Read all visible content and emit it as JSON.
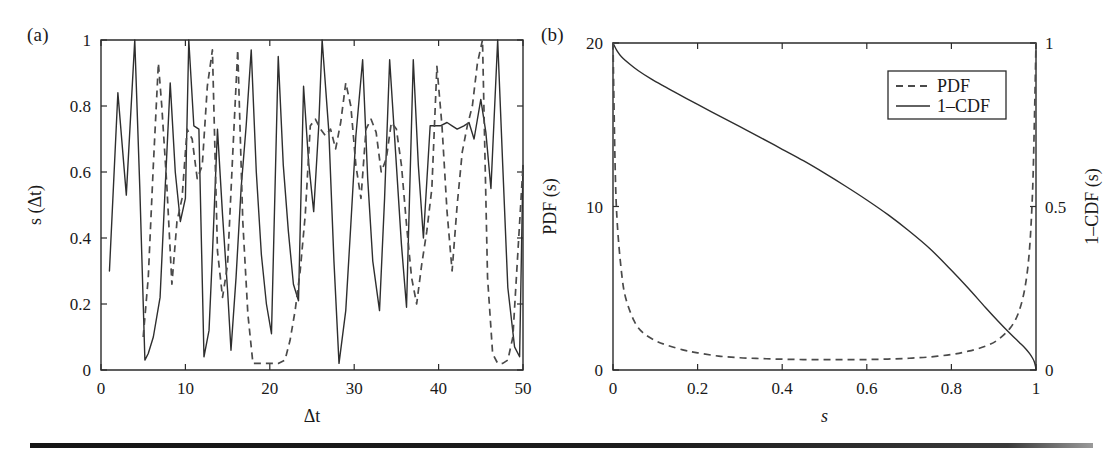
{
  "figure": {
    "panel_a_label": "(a)",
    "panel_b_label": "(b)"
  },
  "chart_data": [
    {
      "type": "line",
      "panel": "(a)",
      "title": "",
      "xlabel": "Δt",
      "ylabel": "s (Δt)",
      "xlim": [
        0,
        50
      ],
      "ylim": [
        0,
        1
      ],
      "xticks": [
        0,
        10,
        20,
        30,
        40,
        50
      ],
      "xtick_labels": [
        "0",
        "10",
        "20",
        "30",
        "40",
        "50"
      ],
      "yticks": [
        0,
        0.2,
        0.4,
        0.6,
        0.8,
        1
      ],
      "ytick_labels": [
        "0",
        "0.2",
        "0.4",
        "0.6",
        "0.8",
        "1"
      ],
      "grid": false,
      "legend": null,
      "series": [
        {
          "name": "solid-series",
          "style": "solid",
          "x": [
            1,
            2,
            3,
            4,
            4.6,
            5.2,
            5.6,
            6.2,
            7,
            7.6,
            8.2,
            8.8,
            9.4,
            10,
            10.4,
            11,
            11.6,
            12.2,
            12.8,
            13.2,
            13.8,
            14.4,
            15,
            15.4,
            16,
            16.6,
            17.2,
            17.8,
            18.4,
            19,
            19.6,
            20.2,
            21,
            21.6,
            22.2,
            22.8,
            23.4,
            24,
            24.6,
            25.2,
            25.8,
            26.2,
            27,
            27.6,
            28.2,
            29,
            29.6,
            30.2,
            31,
            31.6,
            32.2,
            33,
            33.6,
            34.2,
            35,
            35.6,
            36.2,
            37,
            37.6,
            38.2,
            39,
            39.6,
            40.2,
            41,
            41.6,
            42.2,
            43,
            43.6,
            44.2,
            45,
            45.6,
            46.2,
            47,
            47.6,
            48.2,
            49,
            49.6,
            50
          ],
          "y": [
            0.3,
            0.84,
            0.53,
            1.0,
            0.55,
            0.03,
            0.05,
            0.1,
            0.22,
            0.55,
            0.87,
            0.6,
            0.45,
            0.52,
            1.0,
            0.74,
            0.73,
            0.04,
            0.12,
            0.35,
            0.73,
            0.47,
            0.24,
            0.06,
            0.28,
            0.55,
            0.74,
            0.97,
            0.6,
            0.35,
            0.2,
            0.11,
            0.95,
            0.62,
            0.42,
            0.26,
            0.21,
            0.86,
            0.63,
            0.48,
            0.74,
            1.0,
            0.72,
            0.33,
            0.02,
            0.18,
            0.44,
            0.71,
            0.94,
            0.58,
            0.33,
            0.18,
            0.52,
            0.94,
            0.62,
            0.38,
            0.19,
            0.94,
            0.62,
            0.4,
            0.74,
            0.74,
            0.74,
            0.75,
            0.74,
            0.73,
            0.74,
            0.75,
            0.7,
            0.82,
            0.72,
            0.55,
            1.0,
            0.62,
            0.25,
            0.07,
            0.04,
            0.62
          ],
          "description": "Solid oscillating similarity trace"
        },
        {
          "name": "dashed-series",
          "style": "dashed",
          "x": [
            5,
            5.6,
            6.2,
            6.8,
            7.2,
            7.8,
            8.4,
            9,
            9.6,
            10.2,
            10.8,
            11.4,
            12,
            12.6,
            13.2,
            13.8,
            14.4,
            15,
            15.6,
            16.2,
            16.8,
            17.4,
            18,
            19,
            20,
            21,
            21.8,
            22.4,
            23,
            23.6,
            24.2,
            24.8,
            25.4,
            26,
            26.6,
            27.2,
            27.8,
            28.4,
            29,
            29.6,
            30.2,
            30.8,
            31.4,
            32,
            32.6,
            33.2,
            33.8,
            34.4,
            35,
            35.6,
            36.2,
            36.8,
            37.4,
            38,
            38.6,
            39.2,
            39.8,
            40.4,
            41,
            41.6,
            42.2,
            42.8,
            43.4,
            44,
            44.6,
            45.2,
            45.8,
            46.4,
            47,
            47.6,
            48.2,
            48.8,
            49.4,
            50
          ],
          "y": [
            0.1,
            0.28,
            0.62,
            0.93,
            0.8,
            0.56,
            0.26,
            0.45,
            0.52,
            0.73,
            0.7,
            0.58,
            0.62,
            0.86,
            0.97,
            0.36,
            0.22,
            0.32,
            0.65,
            0.97,
            0.45,
            0.17,
            0.02,
            0.02,
            0.02,
            0.02,
            0.03,
            0.09,
            0.18,
            0.3,
            0.47,
            0.74,
            0.76,
            0.73,
            0.71,
            0.73,
            0.67,
            0.75,
            0.87,
            0.8,
            0.62,
            0.52,
            0.73,
            0.76,
            0.72,
            0.6,
            0.64,
            0.75,
            0.73,
            0.62,
            0.44,
            0.28,
            0.2,
            0.32,
            0.42,
            0.55,
            0.92,
            0.74,
            0.48,
            0.3,
            0.5,
            0.66,
            0.74,
            0.8,
            0.93,
            1.0,
            0.28,
            0.05,
            0.02,
            0.02,
            0.03,
            0.1,
            0.36,
            0.62
          ],
          "description": "Dashed oscillating similarity trace"
        }
      ]
    },
    {
      "type": "line",
      "panel": "(b)",
      "title": "",
      "xlabel": "s",
      "ylabel": "PDF (s)",
      "ylabel_right": "1–CDF (s)",
      "xlim": [
        0,
        1
      ],
      "ylim": [
        0,
        20
      ],
      "ylim_right": [
        0,
        1
      ],
      "xticks": [
        0,
        0.2,
        0.4,
        0.6,
        0.8,
        1
      ],
      "xtick_labels": [
        "0",
        "0.2",
        "0.4",
        "0.6",
        "0.8",
        "1"
      ],
      "yticks": [
        0,
        10,
        20
      ],
      "ytick_labels": [
        "0",
        "10",
        "20"
      ],
      "yticks_right": [
        0,
        0.5,
        1
      ],
      "ytick_labels_right": [
        "0",
        "0.5",
        "1"
      ],
      "grid": false,
      "legend": {
        "position": "upper-right",
        "entries": [
          {
            "label": "PDF",
            "style": "dashed"
          },
          {
            "label": "1–CDF",
            "style": "solid"
          }
        ]
      },
      "series": [
        {
          "name": "PDF",
          "style": "dashed",
          "axis": "left",
          "x": [
            0.0,
            0.005,
            0.01,
            0.02,
            0.03,
            0.05,
            0.07,
            0.1,
            0.13,
            0.17,
            0.2,
            0.25,
            0.3,
            0.35,
            0.4,
            0.45,
            0.5,
            0.55,
            0.6,
            0.65,
            0.7,
            0.75,
            0.8,
            0.84,
            0.88,
            0.91,
            0.94,
            0.96,
            0.975,
            0.985,
            0.992,
            0.996,
            1.0
          ],
          "y": [
            20.0,
            12.5,
            9.0,
            6.0,
            4.4,
            3.0,
            2.3,
            1.8,
            1.5,
            1.2,
            1.05,
            0.85,
            0.75,
            0.7,
            0.66,
            0.64,
            0.63,
            0.63,
            0.64,
            0.67,
            0.72,
            0.8,
            0.95,
            1.15,
            1.45,
            1.85,
            2.6,
            3.6,
            5.2,
            7.5,
            11.0,
            15.0,
            20.0
          ]
        },
        {
          "name": "1–CDF",
          "style": "solid",
          "axis": "right",
          "x": [
            0.0,
            0.01,
            0.02,
            0.04,
            0.06,
            0.09,
            0.12,
            0.16,
            0.2,
            0.25,
            0.3,
            0.35,
            0.4,
            0.45,
            0.5,
            0.55,
            0.6,
            0.65,
            0.7,
            0.75,
            0.8,
            0.84,
            0.88,
            0.91,
            0.94,
            0.96,
            0.975,
            0.985,
            0.992,
            0.996,
            0.999,
            1.0
          ],
          "y": [
            1.0,
            0.975,
            0.958,
            0.935,
            0.915,
            0.89,
            0.868,
            0.84,
            0.812,
            0.778,
            0.744,
            0.71,
            0.675,
            0.64,
            0.602,
            0.562,
            0.52,
            0.475,
            0.425,
            0.37,
            0.305,
            0.25,
            0.192,
            0.15,
            0.11,
            0.085,
            0.066,
            0.05,
            0.036,
            0.025,
            0.01,
            0.0
          ]
        }
      ]
    }
  ]
}
